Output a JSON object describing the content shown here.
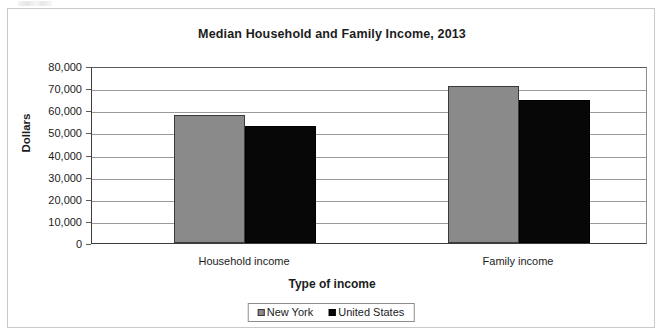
{
  "chart_data": {
    "type": "bar",
    "title": "Median Household and Family Income, 2013",
    "xlabel": "Type of income",
    "ylabel": "Dollars",
    "categories": [
      "Household income",
      "Family income"
    ],
    "series": [
      {
        "name": "New York",
        "color": "#8a8a8a",
        "values": [
          58000,
          71000
        ]
      },
      {
        "name": "United States",
        "color": "#070707",
        "values": [
          53000,
          64500
        ]
      }
    ],
    "ylim": [
      0,
      80000
    ],
    "ytick_step": 10000,
    "ytick_labels": [
      "0",
      "10,000",
      "20,000",
      "30,000",
      "40,000",
      "50,000",
      "60,000",
      "70,000",
      "80,000"
    ],
    "ytick_values": [
      0,
      10000,
      20000,
      30000,
      40000,
      50000,
      60000,
      70000,
      80000
    ],
    "grid": true,
    "grid_axis": "y",
    "legend_position": "bottom",
    "legend_entries": [
      "New York",
      "United States"
    ]
  }
}
